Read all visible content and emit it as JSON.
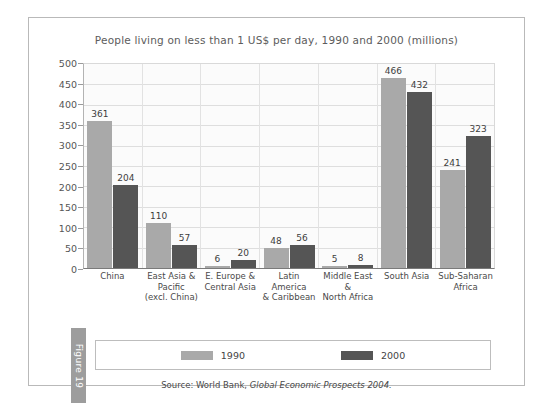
{
  "figure": {
    "tab_label": "Figure 19"
  },
  "chart_data": {
    "type": "bar",
    "title": "People living on less than 1 US$ per day, 1990 and 2000 (millions)",
    "xlabel": "",
    "ylabel": "",
    "ylim": [
      0,
      500
    ],
    "yticks": [
      500,
      450,
      400,
      350,
      300,
      250,
      200,
      150,
      100,
      50,
      0
    ],
    "grid": true,
    "legend_position": "bottom",
    "categories": [
      "China",
      "East Asia &\nPacific\n(excl. China)",
      "E. Europe &\nCentral Asia",
      "Latin America\n& Caribbean",
      "Middle East &\nNorth Africa",
      "South Asia",
      "Sub-Saharan\nAfrica"
    ],
    "series": [
      {
        "name": "1990",
        "color": "#a9a9a9",
        "values": [
          361,
          110,
          6,
          48,
          5,
          466,
          241
        ]
      },
      {
        "name": "2000",
        "color": "#555555",
        "values": [
          204,
          57,
          20,
          56,
          8,
          432,
          323
        ]
      }
    ],
    "source_prefix": "Source: World Bank, ",
    "source_italic": "Global Economic Prospects 2004."
  }
}
